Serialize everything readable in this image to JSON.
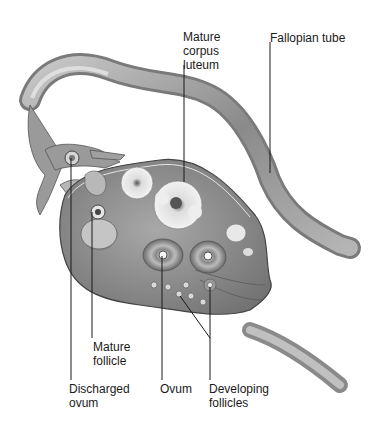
{
  "diagram": {
    "labels": {
      "mature_corpus_luteum": "Mature\ncorpus\nluteum",
      "fallopian_tube": "Fallopian tube",
      "mature_follicle": "Mature\nfollicle",
      "discharged_ovum": "Discharged\novum",
      "ovum": "Ovum",
      "developing_follicles": "Developing\nfollicles"
    },
    "colors": {
      "background": "#ffffff",
      "tissue_dark": "#6e6e6e",
      "tissue_mid": "#9a9a9a",
      "tissue_light": "#cfcfcf",
      "leader_line": "#1a1a1a"
    }
  }
}
